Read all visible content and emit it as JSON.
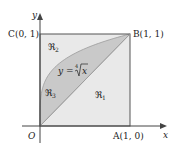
{
  "figure": {
    "axes": {
      "x_label": "x",
      "y_label": "y"
    },
    "points": {
      "origin": "O",
      "A": "A(1, 0)",
      "B": "B(1, 1)",
      "C": "C(0, 1)"
    },
    "curve_label": {
      "prefix": "y = ",
      "root_index": "4",
      "radicand": "x"
    },
    "regions": {
      "r1": {
        "script": "ℜ",
        "sub": "1"
      },
      "r2": {
        "script": "ℜ",
        "sub": "2"
      },
      "r3": {
        "script": "ℜ",
        "sub": "3"
      }
    },
    "colors": {
      "light_fill": "#e9e9e9",
      "dark_fill": "#c9c9c9",
      "line": "#555555",
      "curve": "#8a8a8a"
    }
  }
}
